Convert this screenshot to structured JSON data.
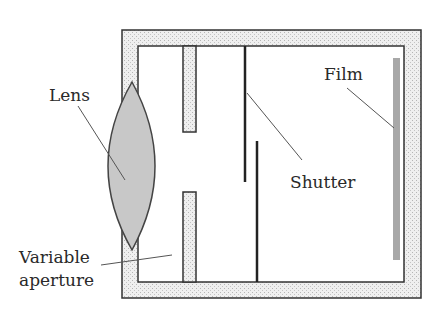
{
  "diagram": {
    "labels": {
      "lens": "Lens",
      "film": "Film",
      "shutter": "Shutter",
      "aperture_line1": "Variable",
      "aperture_line2": "aperture"
    },
    "colors": {
      "body_fill": "#e6e6e6",
      "outline": "#333333",
      "lens_fill": "#c8c8c8",
      "film_fill": "#a8a8a8",
      "leader": "#555555"
    }
  }
}
